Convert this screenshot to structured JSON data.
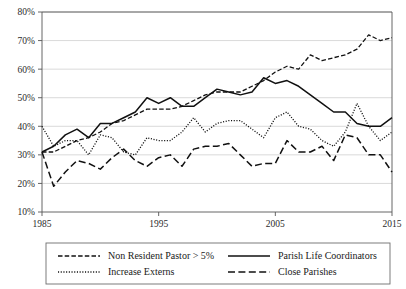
{
  "chart_data": {
    "type": "line",
    "title": "",
    "xlabel": "",
    "ylabel": "",
    "xlim": [
      1985,
      2015
    ],
    "ylim": [
      10,
      80
    ],
    "grid": true,
    "legend_position": "below",
    "x_ticks": [
      "1985",
      "1995",
      "2005",
      "2015"
    ],
    "x_tick_values": [
      1985,
      1995,
      2005,
      2015
    ],
    "y_ticks": [
      "10%",
      "20%",
      "30%",
      "40%",
      "50%",
      "60%",
      "70%",
      "80%"
    ],
    "y_tick_values": [
      10,
      20,
      30,
      40,
      50,
      60,
      70,
      80
    ],
    "x": [
      1985,
      1986,
      1987,
      1988,
      1989,
      1990,
      1991,
      1992,
      1993,
      1994,
      1995,
      1996,
      1997,
      1998,
      1999,
      2000,
      2001,
      2002,
      2003,
      2004,
      2005,
      2006,
      2007,
      2008,
      2009,
      2010,
      2011,
      2012,
      2013,
      2014,
      2015
    ],
    "series": [
      {
        "name": "Non Resident Pastor > 5%",
        "style": "dashed",
        "values": [
          31,
          31,
          33,
          35,
          36,
          38,
          41,
          42,
          44,
          46,
          46,
          46,
          47,
          49,
          51,
          52,
          52,
          52,
          54,
          56,
          59,
          61,
          60,
          65,
          63,
          64,
          65,
          67,
          72,
          70,
          71
        ]
      },
      {
        "name": "Parish Life Coordinators",
        "style": "solid",
        "values": [
          31,
          33,
          37,
          39,
          36,
          41,
          41,
          43,
          45,
          50,
          48,
          50,
          47,
          47,
          50,
          53,
          52,
          51,
          52,
          57,
          55,
          56,
          54,
          51,
          48,
          45,
          45,
          41,
          40,
          40,
          43
        ]
      },
      {
        "name": "Increase Externs",
        "style": "dotted",
        "values": [
          40,
          33,
          35,
          35,
          30,
          37,
          36,
          31,
          30,
          36,
          35,
          35,
          38,
          43,
          38,
          41,
          42,
          42,
          39,
          36,
          43,
          45,
          40,
          39,
          35,
          33,
          38,
          48,
          40,
          35,
          38
        ]
      },
      {
        "name": "Close Parishes",
        "style": "longdash",
        "values": [
          31,
          19,
          24,
          28,
          27,
          25,
          29,
          32,
          28,
          26,
          29,
          30,
          26,
          32,
          33,
          33,
          34,
          30,
          26,
          27,
          27,
          35,
          31,
          31,
          33,
          28,
          37,
          36,
          30,
          30,
          24
        ]
      }
    ]
  },
  "legend": {
    "items": [
      {
        "label": "Non Resident Pastor > 5%",
        "style": "dashed"
      },
      {
        "label": "Parish Life Coordinators",
        "style": "solid"
      },
      {
        "label": "Increase Externs",
        "style": "dotted"
      },
      {
        "label": "Close Parishes",
        "style": "longdash"
      }
    ]
  },
  "colors": {
    "line": "#111111",
    "grid": "#c9c9c9",
    "axis": "#555555",
    "background": "#ffffff"
  }
}
